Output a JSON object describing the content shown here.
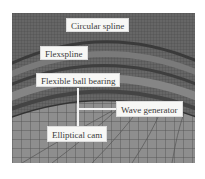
{
  "figure": {
    "colors": {
      "mesh_background": "#6e6e6e",
      "mesh_lines": "#3c3c3c",
      "cam_mesh_fill": "#8c8c8c",
      "label_background": "#f7f7f5",
      "label_text": "#3a3a3a"
    }
  },
  "labels": {
    "circular_spline": "Circular spline",
    "flexspline": "Flexspline",
    "flexible_ball_bearing": "Flexible ball bearing",
    "wave_generator": "Wave generator",
    "elliptical_cam": "Elliptical cam"
  }
}
